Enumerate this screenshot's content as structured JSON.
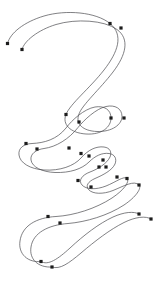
{
  "document": {
    "title": "Spline Path",
    "width": 162,
    "height": 284,
    "background_color": "#ffffff"
  },
  "style": {
    "stroke_color": "#4a4a4f",
    "stroke_width": 0.7,
    "anchor_color": "#1c1c1c",
    "anchor_size": 3.2
  },
  "chart_data": {
    "type": "scatter",
    "title": "",
    "subtitle": "",
    "xlabel": "",
    "ylabel": "",
    "grid": false,
    "legend": null,
    "xlim": [
      0,
      162
    ],
    "ylim": [
      0,
      284
    ],
    "series": [
      {
        "name": "outer-spline",
        "path": "M 7.5,43.5 C 10,33 24,22 44,16 C 66,9.5 96,12 110,23.5 C 124,35 118,52 104,70 C 90,88 70,104 66,114.5 C 62,124 70,133 86,134 C 102,135 111,127 111,118 C 111,109.5 104,105.5 95,107 C 84,109 72,120 66,128 C 57,139.5 44,143 32,143.5 C 24,143.8 18,148 19,155 C 20,163 30,169 44,170 C 60,171 74,166 81,158 C 88,150 96,146 104,147 C 110,147.8 112,152 110,157 C 107,163.5 98,169 90,172 C 82,175 78,180.5 82,185 C 86,189.5 96,190 106,186 C 116,182 124,175.5 127,178.5 C 130,181.5 124,190 112,198 C 96,208.5 74,215.5 56,216.5 C 36,217.6 22,226 20,241 C 18,254 28,263 41,261.5",
        "anchors": [
          {
            "x": 7.5,
            "y": 43.5,
            "type": "endpoint"
          },
          {
            "x": 110,
            "y": 23.5,
            "type": "smooth"
          },
          {
            "x": 66,
            "y": 114.5,
            "type": "smooth"
          },
          {
            "x": 111,
            "y": 118,
            "type": "smooth"
          },
          {
            "x": 26,
            "y": 143.5,
            "type": "smooth"
          },
          {
            "x": 81,
            "y": 153.5,
            "type": "smooth"
          },
          {
            "x": 103,
            "y": 160,
            "type": "smooth"
          },
          {
            "x": 99,
            "y": 167,
            "type": "smooth"
          },
          {
            "x": 78,
            "y": 180.5,
            "type": "smooth"
          },
          {
            "x": 117,
            "y": 177,
            "type": "smooth"
          },
          {
            "x": 127,
            "y": 178.5,
            "type": "smooth"
          },
          {
            "x": 48,
            "y": 216.5,
            "type": "smooth"
          },
          {
            "x": 41,
            "y": 261.5,
            "type": "endpoint"
          }
        ]
      },
      {
        "name": "inner-spline",
        "path": "M 22,49.5 C 24,41 38,30 56,24.5 C 76,18.5 104,20 117,29.5 C 130,39 126,55 113,72 C 100,89 82,105 79,114 C 75,124 83,131 97,131.5 C 112,132 122,124.5 122,116.5 C 122,108.5 115,104.5 106,106.5 C 96,108.7 84,120 78,127.5 C 69,139 56,147 44,148.5 C 36,149.5 30,154 31,160 C 32,167 42,172 55,172.5 C 70,173 82,169 89,162 C 95,156 102,152.5 109,153.5 C 115,154.3 117,159 115,164 C 112,170.5 103,175 95,178.5 C 88,181.5 85,186 89,190 C 93,194 103,194.5 113,190.5 C 124,186 134,180 139,185 C 142,188 136,197 124,205 C 108,215.5 86,222 68,223.5 C 48,225 33,233 31,247 C 29,259 38,268 52,267",
        "anchors": [
          {
            "x": 22,
            "y": 49.5,
            "type": "endpoint"
          },
          {
            "x": 121,
            "y": 28,
            "type": "smooth"
          },
          {
            "x": 79,
            "y": 122,
            "type": "smooth"
          },
          {
            "x": 124,
            "y": 118,
            "type": "smooth"
          },
          {
            "x": 37,
            "y": 149,
            "type": "smooth"
          },
          {
            "x": 69,
            "y": 148,
            "type": "smooth"
          },
          {
            "x": 89,
            "y": 156,
            "type": "smooth"
          },
          {
            "x": 106,
            "y": 167,
            "type": "smooth"
          },
          {
            "x": 91,
            "y": 187,
            "type": "smooth"
          },
          {
            "x": 139,
            "y": 185,
            "type": "smooth"
          },
          {
            "x": 60,
            "y": 223,
            "type": "smooth"
          },
          {
            "x": 52,
            "y": 267,
            "type": "endpoint"
          }
        ]
      },
      {
        "name": "lower-right-outer-spline",
        "path": "M 139,214 C 134,211 124,212 113,217 C 99,223.5 84,235 70,248 C 58,259 48,266 41,261.5",
        "anchors": [
          {
            "x": 139,
            "y": 214,
            "type": "endpoint"
          }
        ]
      },
      {
        "name": "lower-right-inner-spline",
        "path": "M 151,219 C 146,215.5 135,217 124,222.5 C 110,229.5 95,241 81,253 C 69,263 60,270 52,267",
        "anchors": [
          {
            "x": 151,
            "y": 219,
            "type": "endpoint"
          }
        ]
      }
    ],
    "anchor_count": 29
  }
}
